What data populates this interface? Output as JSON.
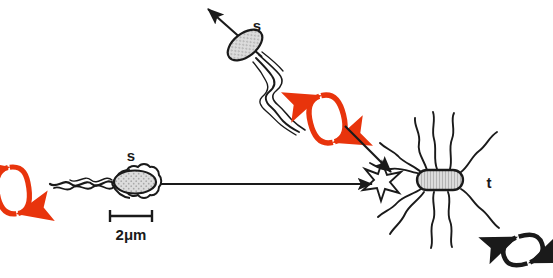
{
  "figure": {
    "type": "scientific-diagram",
    "background_color": "#ffffff",
    "width": 553,
    "height": 278
  },
  "colors": {
    "ink": "#1a1a1a",
    "rotation_red": "#e8340c",
    "cell_fill": "#d8d8d8",
    "cell_stroke": "#1a1a1a",
    "background": "#ffffff"
  },
  "cells": [
    {
      "id": "swimming-cell-upper",
      "label": "s",
      "label_x": 257,
      "label_y": 31,
      "body_cx": 245,
      "body_cy": 45,
      "body_rx": 19,
      "body_ry": 11,
      "body_rotation": -38,
      "flagella_style": "polar-bundle",
      "motility": "swimming",
      "rotation_arrow": "red",
      "direction_arrow": "up-left"
    },
    {
      "id": "swimming-cell-left",
      "label": "s",
      "label_x": 131,
      "label_y": 161,
      "body_cx": 133,
      "body_cy": 182,
      "body_rx": 21,
      "body_ry": 12,
      "body_rotation": 0,
      "flagella_style": "polar-bundle",
      "motility": "swimming",
      "rotation_arrow": "red",
      "direction_arrow": "right"
    },
    {
      "id": "tumbling-cell-right",
      "label": "t",
      "label_x": 489,
      "label_y": 188,
      "body_cx": 440,
      "body_cy": 180,
      "body_w": 46,
      "body_h": 19,
      "flagella_style": "peritrichous",
      "flagella_count": 10,
      "motility": "tumbling",
      "rotation_arrow": "black"
    }
  ],
  "labels": {
    "swimming_upper": "s",
    "swimming_left": "s",
    "tumbling_right": "t"
  },
  "scale_bar": {
    "value": "2",
    "unit": "μm",
    "full_label": "2μm",
    "x_start": 109,
    "x_end": 152,
    "y": 216,
    "text_x": 130,
    "text_y": 238
  },
  "rotation_arrows": [
    {
      "id": "rotation-arrow-left",
      "color": "#e8340c",
      "cx": 13,
      "cy": 190,
      "rx": 15,
      "ry": 25,
      "tilt": -8
    },
    {
      "id": "rotation-arrow-upper",
      "color": "#e8340c",
      "cx": 327,
      "cy": 119,
      "rx": 16,
      "ry": 25,
      "tilt": -14
    },
    {
      "id": "rotation-arrow-tumbling",
      "color": "#1a1a1a",
      "cx": 523,
      "cy": 250,
      "rx": 20,
      "ry": 14,
      "tilt": -18
    }
  ],
  "motion_arrows": [
    {
      "id": "motion-arrow-upper-cell",
      "from_x": 262,
      "from_y": 57,
      "to_x": 205,
      "to_y": 6,
      "color": "#1a1a1a"
    },
    {
      "id": "motion-arrow-left-cell",
      "from_x": 160,
      "from_y": 184,
      "to_x": 371,
      "to_y": 184,
      "color": "#1a1a1a"
    },
    {
      "id": "motion-arrow-diagonal",
      "from_x": 345,
      "from_y": 126,
      "to_x": 394,
      "to_y": 175,
      "color": "#1a1a1a"
    }
  ],
  "collision_marker": {
    "id": "collision-star",
    "cx": 382,
    "cy": 181,
    "points": 5,
    "outer_r": 19,
    "inner_r": 7,
    "color": "#1a1a1a"
  }
}
